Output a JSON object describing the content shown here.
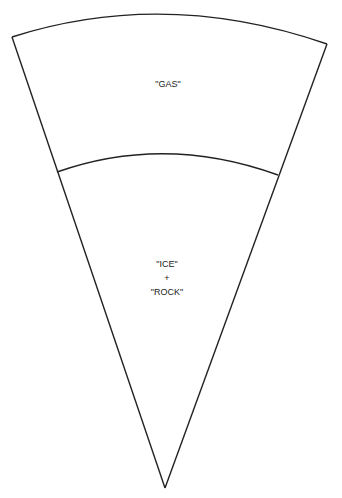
{
  "diagram": {
    "type": "planetary-interior-wedge",
    "regions": [
      {
        "id": "outer",
        "label": "\"GAS\""
      },
      {
        "id": "inner",
        "lines": [
          "\"ICE\"",
          "+",
          "\"ROCK\""
        ]
      }
    ],
    "stroke_color": "#222222",
    "background": "#ffffff"
  }
}
